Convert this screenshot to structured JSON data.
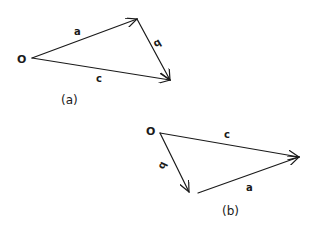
{
  "diagram_a": {
    "caption": "(a)",
    "origin_label": "O",
    "vectors": [
      {
        "name": "a",
        "label": "a",
        "from": [
          32,
          58
        ],
        "to": [
          137,
          19
        ],
        "label_pos": [
          77,
          35
        ],
        "label_rotate": 0
      },
      {
        "name": "b",
        "label": "b",
        "from": [
          137,
          19
        ],
        "to": [
          170,
          80
        ],
        "label_pos": [
          158,
          45
        ],
        "label_rotate": -30
      },
      {
        "name": "c",
        "label": "c",
        "from": [
          32,
          58
        ],
        "to": [
          170,
          80
        ],
        "label_pos": [
          99,
          81
        ],
        "label_rotate": 0
      }
    ],
    "origin_label_pos": [
      17,
      63
    ],
    "caption_pos": [
      61,
      104
    ]
  },
  "diagram_b": {
    "caption": "(b)",
    "origin_label": "O",
    "vectors": [
      {
        "name": "c",
        "label": "c",
        "from": [
          160,
          133
        ],
        "to": [
          299,
          157
        ],
        "label_pos": [
          226,
          138
        ],
        "label_rotate": 0
      },
      {
        "name": "b",
        "label": "b",
        "from": [
          160,
          133
        ],
        "to": [
          189,
          192
        ],
        "label_pos": [
          163,
          168
        ],
        "label_rotate": -115
      },
      {
        "name": "a",
        "label": "a",
        "from": [
          198,
          193
        ],
        "to": [
          299,
          157
        ],
        "label_pos": [
          249,
          191
        ],
        "label_rotate": 0
      }
    ],
    "origin_label_pos": [
      146,
      135
    ],
    "caption_pos": [
      222,
      215
    ]
  },
  "style": {
    "stroke_color": "#1a1a1a",
    "background": "#ffffff"
  }
}
